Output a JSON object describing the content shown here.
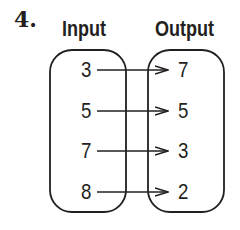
{
  "problem_number": "4.",
  "headers": {
    "input": "Input",
    "output": "Output"
  },
  "mapping": [
    {
      "input": "3",
      "output": "7"
    },
    {
      "input": "5",
      "output": "5"
    },
    {
      "input": "7",
      "output": "3"
    },
    {
      "input": "8",
      "output": "2"
    }
  ],
  "colors": {
    "stroke": "#231f20",
    "background": "#ffffff"
  }
}
